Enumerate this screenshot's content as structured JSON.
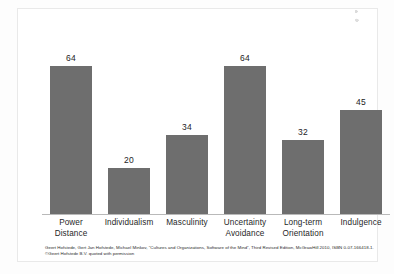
{
  "chart_data": {
    "type": "bar",
    "title": "",
    "subtitle": "",
    "xlabel": "",
    "ylabel": "",
    "ylim": [
      0,
      100
    ],
    "grid": false,
    "legend": "none",
    "categories": [
      "Power Distance",
      "Individualism",
      "Masculinity",
      "Uncertainty Avoidance",
      "Long-term Orientation",
      "Indulgence"
    ],
    "category_lines": [
      [
        "Power",
        "Distance"
      ],
      [
        "Individualism"
      ],
      [
        "Masculinity"
      ],
      [
        "Uncertainty",
        "Avoidance"
      ],
      [
        "Long-term",
        "Orientation"
      ],
      [
        "Indulgence"
      ]
    ],
    "values": [
      64,
      20,
      34,
      64,
      32,
      45
    ],
    "value_labels": [
      "64",
      "20",
      "34",
      "64",
      "32",
      "45"
    ],
    "bar_color": "#6e6e6e",
    "axis_color": "#b9b9b9",
    "background": "#ffffff"
  },
  "citation": {
    "text": "Geert Hofstede, Gert Jan Hofstede, Michael Minkov, \"Cultures and Organizations, Software of the Mind\", Third Revised Edition, McGrawHill 2010, ISBN 0-07-166418-1. ©Geert Hofstede B.V. quoted with permission"
  }
}
